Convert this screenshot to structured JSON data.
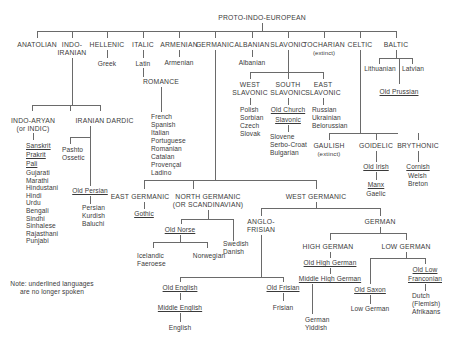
{
  "root": "PROTO-INDO-EUROPEAN",
  "branches": {
    "anatolian": "ANATOLIAN",
    "indo_iranian": [
      "INDO-",
      "IRANIAN"
    ],
    "hellenic": "HELLENIC",
    "italic": "ITALIC",
    "armenian": "ARMENIAN",
    "germanic": "GERMANIC",
    "albanian": "ALBANIAN",
    "slavonic": "SLAVONIC",
    "tocharian": "TOCHARIAN",
    "tocharian_note": "(extinct)",
    "celtic": "CELTIC",
    "baltic": "BALTIC"
  },
  "hellenic": {
    "greek": "Greek"
  },
  "italic": {
    "latin": "Latin",
    "romance": "ROMANCE",
    "romance_langs": [
      "French",
      "Spanish",
      "Italian",
      "Portuguese",
      "Romanian",
      "Catalan",
      "Provençal",
      "Ladino"
    ]
  },
  "armenian": {
    "armenian": "Armenian"
  },
  "albanian": {
    "albanian": "Albanian"
  },
  "slavonic": {
    "west": [
      "WEST",
      "SLAVONIC"
    ],
    "south": [
      "SOUTH",
      "SLAVONIC"
    ],
    "east": [
      "EAST",
      "SLAVONIC"
    ],
    "west_langs": [
      "Polish",
      "Sorbian",
      "Czech",
      "Slovak"
    ],
    "old_church": [
      "Old Church",
      "Slavonic"
    ],
    "south_langs": [
      "Slovene",
      "Serbo-Croat",
      "Bulgarian"
    ],
    "east_langs": [
      "Russian",
      "Ukrainian",
      "Belorussian"
    ]
  },
  "baltic": {
    "lithuanian": "Lithuanian",
    "latvian": "Latvian",
    "old_prussian": "Old Prussian"
  },
  "indo_iranian": {
    "indo_aryan": [
      "INDO-ARYAN",
      "(or INDIC)"
    ],
    "iranian": "IRANIAN",
    "dardic": "DARDIC",
    "sanskrit": "Sanskrit",
    "prakrit": "Prakrit",
    "pali": "Pali",
    "indic_langs": [
      "Gujarati",
      "Marathi",
      "Hindustani",
      "Hindi",
      "Urdu",
      "Bengali",
      "Sindhi",
      "Sinhalese",
      "Rajasthani",
      "Punjabi"
    ],
    "iranian_langs1": [
      "Pashto",
      "Ossetic"
    ],
    "old_persian": "Old Persian",
    "iranian_langs2": [
      "Persian",
      "Kurdish",
      "Baluchi"
    ]
  },
  "celtic": {
    "gaulish": [
      "GAULISH",
      "(extinct)"
    ],
    "goidelic": "GOIDELIC",
    "brythonic": "BRYTHONIC",
    "old_irish": "Old Irish",
    "manx": "Manx",
    "gaelic": "Gaelic",
    "cornish": "Cornish",
    "brythonic_langs": [
      "Welsh",
      "Breton"
    ]
  },
  "germanic": {
    "east": "EAST GERMANIC",
    "gothic": "Gothic",
    "north": [
      "NORTH GERMANIC",
      "(OR SCANDINAVIAN)"
    ],
    "old_norse": "Old Norse",
    "icelandic": [
      "Icelandic",
      "Faeroese"
    ],
    "norwegian": "Norwegian",
    "swedish": [
      "Swedish",
      "Danish"
    ],
    "west": "WEST GERMANIC",
    "anglo_frisian": [
      "ANGLO-",
      "FRISIAN"
    ],
    "old_english": "Old English",
    "middle_english": "Middle English",
    "english": "English",
    "old_frisian": "Old Frisian",
    "frisian": "Frisian",
    "german": "GERMAN",
    "high_german": "HIGH GERMAN",
    "low_german": "LOW GERMAN",
    "old_high_german": "Old High German",
    "middle_high_german": "Middle High German",
    "german_yiddish": [
      "German",
      "Yiddish"
    ],
    "old_saxon": "Old Saxon",
    "low_german_lang": "Low German",
    "old_low_franconian": [
      "Old Low",
      "Franconian"
    ],
    "dutch": [
      "Dutch",
      "(Flemish)",
      "Afrikaans"
    ]
  },
  "note": [
    "Note: underlined languages",
    "are no longer spoken"
  ]
}
